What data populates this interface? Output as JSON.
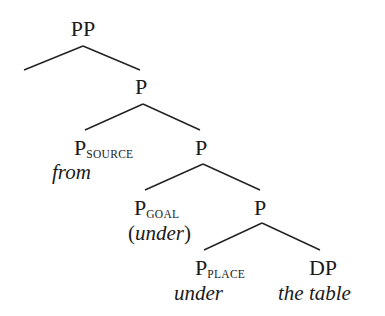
{
  "diagram": {
    "type": "syntax-tree",
    "nodes": {
      "pp": {
        "label": "PP"
      },
      "p1": {
        "label": "P"
      },
      "p_source": {
        "label": "P",
        "sub": "SOURCE",
        "word": "from"
      },
      "p2": {
        "label": "P"
      },
      "p_goal": {
        "label": "P",
        "sub": "GOAL",
        "word_open": "(",
        "word": "under",
        "word_close": ")"
      },
      "p3": {
        "label": "P"
      },
      "p_place": {
        "label": "P",
        "sub": "PLACE",
        "word": "under"
      },
      "dp": {
        "label": "DP",
        "word": "the table"
      }
    },
    "edges": [
      [
        "pp",
        "spec-empty"
      ],
      [
        "pp",
        "p1"
      ],
      [
        "p1",
        "p_source"
      ],
      [
        "p1",
        "p2"
      ],
      [
        "p2",
        "p_goal"
      ],
      [
        "p2",
        "p3"
      ],
      [
        "p3",
        "p_place"
      ],
      [
        "p3",
        "dp"
      ]
    ]
  }
}
